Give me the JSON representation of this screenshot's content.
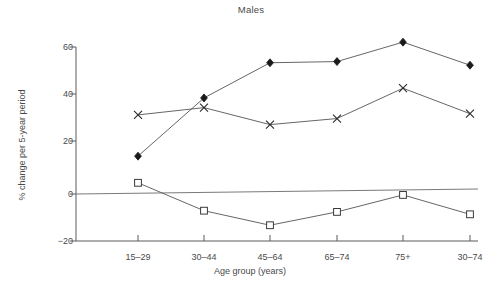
{
  "chart_data": {
    "type": "line",
    "title": "Males",
    "xlabel": "Age group (years)",
    "ylabel": "% change per 5-year period",
    "categories": [
      "15–29",
      "30–44",
      "45–64",
      "65–74",
      "75+",
      "30–74"
    ],
    "ytick_labels": [
      "60",
      "40",
      "20",
      "0",
      "−20"
    ],
    "ytick_values": [
      60,
      40,
      20,
      0,
      -20
    ],
    "ylim": [
      -20,
      60
    ],
    "grid": false,
    "legend_position": "none",
    "reference_line": {
      "label": "zero reference line",
      "y_left": 0,
      "y_right": 2
    },
    "series": [
      {
        "name": "diamond-series",
        "marker": "filled-diamond",
        "values": [
          15,
          39,
          53.5,
          54,
          62,
          52.5
        ],
        "connected_through": 5
      },
      {
        "name": "cross-series",
        "marker": "cross",
        "values": [
          32,
          35,
          28,
          30.5,
          43,
          32.5
        ],
        "connected_through": 5
      },
      {
        "name": "square-series",
        "marker": "open-square",
        "values": [
          4,
          -7.5,
          -13.5,
          -8,
          -1,
          -9
        ],
        "connected_through": 5
      }
    ]
  }
}
